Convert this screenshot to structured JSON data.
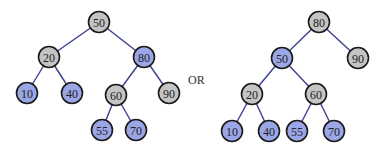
{
  "colors": {
    "gray_node": "#c4c4c4",
    "blue_node": "#9aa6e6",
    "edge": "#3a3f8f",
    "stroke": "#1a1a1a"
  },
  "separator": "OR",
  "trees": [
    {
      "name": "left-tree",
      "nodes": [
        {
          "id": "L50",
          "label": "50",
          "x": 99,
          "y": 22,
          "color": "gray"
        },
        {
          "id": "L20",
          "label": "20",
          "x": 49,
          "y": 57,
          "color": "gray"
        },
        {
          "id": "L80",
          "label": "80",
          "x": 144,
          "y": 57,
          "color": "blue"
        },
        {
          "id": "L10",
          "label": "10",
          "x": 27,
          "y": 93,
          "color": "blue"
        },
        {
          "id": "L40",
          "label": "40",
          "x": 72,
          "y": 93,
          "color": "blue"
        },
        {
          "id": "L60",
          "label": "60",
          "x": 116,
          "y": 95,
          "color": "gray"
        },
        {
          "id": "L90",
          "label": "90",
          "x": 169,
          "y": 93,
          "color": "gray"
        },
        {
          "id": "L55",
          "label": "55",
          "x": 102,
          "y": 130,
          "color": "blue"
        },
        {
          "id": "L70",
          "label": "70",
          "x": 136,
          "y": 130,
          "color": "blue"
        }
      ],
      "edges": [
        [
          "L50",
          "L20"
        ],
        [
          "L50",
          "L80"
        ],
        [
          "L20",
          "L10"
        ],
        [
          "L20",
          "L40"
        ],
        [
          "L80",
          "L60"
        ],
        [
          "L80",
          "L90"
        ],
        [
          "L60",
          "L55"
        ],
        [
          "L60",
          "L70"
        ]
      ]
    },
    {
      "name": "right-tree",
      "nodes": [
        {
          "id": "R80",
          "label": "80",
          "x": 319,
          "y": 22,
          "color": "gray"
        },
        {
          "id": "R50",
          "label": "50",
          "x": 282,
          "y": 58,
          "color": "blue"
        },
        {
          "id": "R90",
          "label": "90",
          "x": 358,
          "y": 58,
          "color": "gray"
        },
        {
          "id": "R20",
          "label": "20",
          "x": 252,
          "y": 94,
          "color": "gray"
        },
        {
          "id": "R60",
          "label": "60",
          "x": 316,
          "y": 94,
          "color": "gray"
        },
        {
          "id": "R10",
          "label": "10",
          "x": 232,
          "y": 131,
          "color": "blue"
        },
        {
          "id": "R40",
          "label": "40",
          "x": 269,
          "y": 131,
          "color": "blue"
        },
        {
          "id": "R55",
          "label": "55",
          "x": 297,
          "y": 131,
          "color": "blue"
        },
        {
          "id": "R70",
          "label": "70",
          "x": 334,
          "y": 131,
          "color": "blue"
        }
      ],
      "edges": [
        [
          "R80",
          "R50"
        ],
        [
          "R80",
          "R90"
        ],
        [
          "R50",
          "R20"
        ],
        [
          "R50",
          "R60"
        ],
        [
          "R20",
          "R10"
        ],
        [
          "R20",
          "R40"
        ],
        [
          "R60",
          "R55"
        ],
        [
          "R60",
          "R70"
        ]
      ]
    }
  ]
}
